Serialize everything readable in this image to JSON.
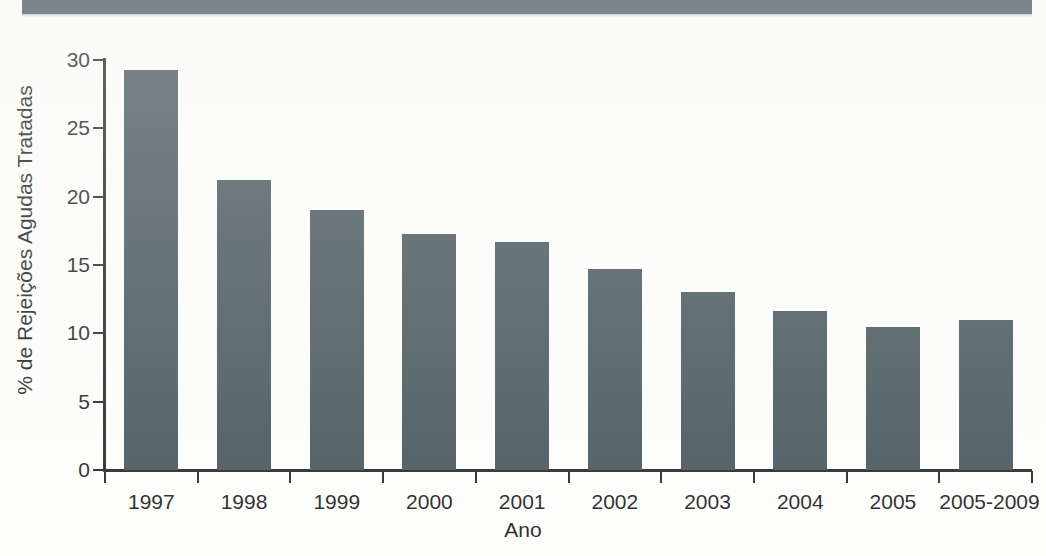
{
  "header": {
    "band_text": "",
    "band_color": "#3c4c54"
  },
  "chart_data": {
    "type": "bar",
    "title": "",
    "xlabel": "Ano",
    "ylabel": "% de Rejeições Agudas Tratadas",
    "categories": [
      "1997",
      "1998",
      "1999",
      "2000",
      "2001",
      "2002",
      "2003",
      "2004",
      "2005",
      "2005-2009"
    ],
    "values": [
      29.3,
      21.2,
      19.0,
      17.3,
      16.7,
      14.7,
      13.0,
      11.6,
      10.5,
      11.0
    ],
    "ylim": [
      0,
      30
    ],
    "yticks": [
      0,
      5,
      10,
      15,
      20,
      25,
      30
    ],
    "ytick_labels": [
      "0",
      "5",
      "10",
      "15",
      "20",
      "25",
      "30"
    ],
    "grid": false,
    "legend": null,
    "bar_color": "#3c4c54",
    "axis_color": "#1b1b1b",
    "background": "#fdfdfc"
  }
}
